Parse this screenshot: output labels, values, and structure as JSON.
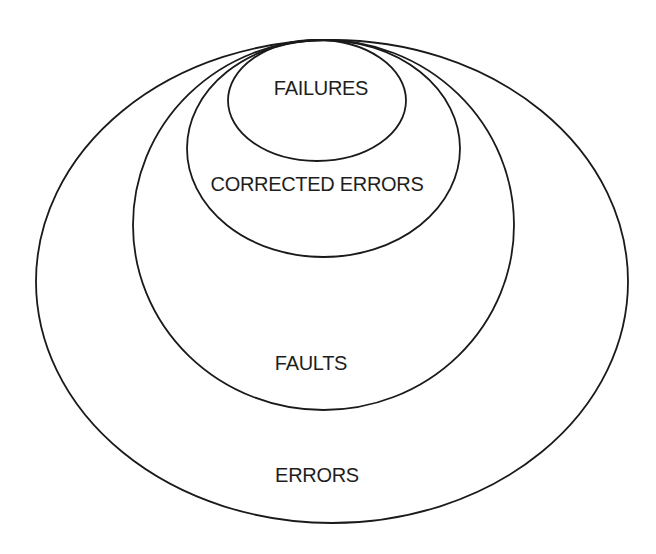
{
  "diagram": {
    "type": "nested-ellipses",
    "background": "#ffffff",
    "stroke_color": "#1a1a1a",
    "text_color": "#1e1e1e",
    "sets": [
      {
        "id": "errors",
        "label": "ERRORS",
        "contains": [
          "faults"
        ],
        "ellipse": {
          "cx": 332,
          "cy": 281.5,
          "rx": 296,
          "ry": 241.5
        },
        "label_pos": {
          "x": 317,
          "y": 482
        }
      },
      {
        "id": "faults",
        "label": "FAULTS",
        "contains": [
          "corrected_errors"
        ],
        "ellipse": {
          "cx": 323.5,
          "cy": 225,
          "rx": 190.5,
          "ry": 185
        },
        "label_pos": {
          "x": 311,
          "y": 370
        }
      },
      {
        "id": "corrected_errors",
        "label": "CORRECTED ERRORS",
        "contains": [
          "failures"
        ],
        "ellipse": {
          "cx": 323.5,
          "cy": 148.5,
          "rx": 136.5,
          "ry": 108.5
        },
        "label_pos": {
          "x": 317,
          "y": 191
        }
      },
      {
        "id": "failures",
        "label": "FAILURES",
        "contains": [],
        "ellipse": {
          "cx": 317,
          "cy": 100.5,
          "rx": 89,
          "ry": 60.5
        },
        "label_pos": {
          "x": 321,
          "y": 95
        }
      }
    ]
  }
}
